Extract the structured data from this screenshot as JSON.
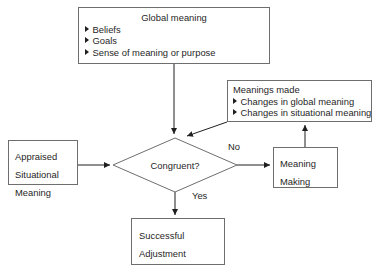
{
  "diagram": {
    "stroke_color": "#6e6e6e",
    "text_color": "#1f1f1f",
    "background": "#ffffff",
    "nodes": {
      "global_meaning": {
        "title": "Global meaning",
        "bullets": [
          "Beliefs",
          "Goals",
          "Sense of meaning or purpose"
        ]
      },
      "meanings_made": {
        "title": "Meanings made",
        "bullets": [
          "Changes in global meaning",
          "Changes in situational meaning"
        ]
      },
      "appraised": {
        "lines": [
          "Appraised",
          "Situational",
          "Meaning"
        ]
      },
      "diamond": {
        "label": "Congruent?"
      },
      "meaning_making": {
        "lines": [
          "Meaning",
          "Making"
        ]
      },
      "successful": {
        "lines": [
          "Successful",
          "Adjustment"
        ]
      }
    },
    "edge_labels": {
      "no": "No",
      "yes": "Yes"
    }
  }
}
